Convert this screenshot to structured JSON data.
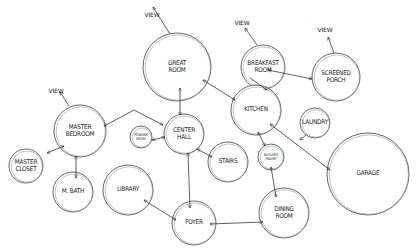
{
  "diagram": {
    "type": "bubble-diagram",
    "view_label": "VIEW",
    "colors": {
      "stroke": "#555555",
      "text": "#222222",
      "background": "#ffffff"
    },
    "rooms": [
      {
        "id": "great-room",
        "label": "GREAT\nROOM",
        "cx": 177,
        "cy": 67,
        "r": 34
      },
      {
        "id": "breakfast-room",
        "label": "BREAKFAST\nROOM",
        "cx": 263,
        "cy": 67,
        "r": 22
      },
      {
        "id": "screened-porch",
        "label": "SCREENED\nPORCH",
        "cx": 336,
        "cy": 77,
        "r": 24
      },
      {
        "id": "kitchen",
        "label": "KITCHEN",
        "cx": 256,
        "cy": 110,
        "r": 25
      },
      {
        "id": "laundry",
        "label": "LAUNDRY",
        "cx": 315,
        "cy": 123,
        "r": 15
      },
      {
        "id": "master-bedroom",
        "label": "MASTER\nBEDROOM",
        "cx": 80,
        "cy": 131,
        "r": 26
      },
      {
        "id": "powder-room",
        "label": "POWDER\nROOM",
        "cx": 141,
        "cy": 137,
        "r": 11,
        "small": true
      },
      {
        "id": "center-hall",
        "label": "CENTER\nHALL",
        "cx": 184,
        "cy": 134,
        "r": 20
      },
      {
        "id": "stairs",
        "label": "STAIRS",
        "cx": 228,
        "cy": 162,
        "r": 20
      },
      {
        "id": "butlers-pantry",
        "label": "BUTLER'S\nPANTRY",
        "cx": 271,
        "cy": 157,
        "r": 13,
        "small": true
      },
      {
        "id": "garage",
        "label": "GARAGE",
        "cx": 368,
        "cy": 174,
        "r": 41
      },
      {
        "id": "master-closet",
        "label": "MASTER\nCLOSET",
        "cx": 26,
        "cy": 166,
        "r": 17
      },
      {
        "id": "m-bath",
        "label": "M. BATH",
        "cx": 73,
        "cy": 192,
        "r": 20
      },
      {
        "id": "library",
        "label": "LIBRARY",
        "cx": 128,
        "cy": 190,
        "r": 25
      },
      {
        "id": "foyer",
        "label": "FOYER",
        "cx": 194,
        "cy": 223,
        "r": 22
      },
      {
        "id": "dining-room",
        "label": "DINING\nROOM",
        "cx": 284,
        "cy": 213,
        "r": 25
      }
    ],
    "views": [
      {
        "from": [
          170,
          34
        ],
        "to": [
          153,
          7
        ],
        "label_x": 152,
        "label_y": 14
      },
      {
        "from": [
          69,
          106
        ],
        "to": [
          60,
          92
        ],
        "label_x": 56,
        "label_y": 90
      },
      {
        "from": [
          257,
          45
        ],
        "to": [
          245,
          28
        ],
        "label_x": 242,
        "label_y": 22
      },
      {
        "from": [
          334,
          53
        ],
        "to": [
          328,
          37
        ],
        "label_x": 325,
        "label_y": 29
      }
    ],
    "connections": [
      {
        "from": [
          104,
          126
        ],
        "to": [
          163,
          125
        ],
        "via": [
          134,
          110
        ],
        "both": true
      },
      {
        "from": [
          180,
          115
        ],
        "to": [
          180,
          88
        ],
        "both": true
      },
      {
        "from": [
          203,
          80
        ],
        "to": [
          235,
          100
        ],
        "both": true
      },
      {
        "from": [
          250,
          78
        ],
        "to": [
          267,
          90
        ],
        "both": false,
        "a": [
          270,
          79
        ],
        "b": [
          243,
          94
        ]
      },
      {
        "from": [
          268,
          70
        ],
        "to": [
          312,
          79
        ],
        "both": true
      },
      {
        "from": [
          152,
          140
        ],
        "to": [
          165,
          137
        ],
        "both": true
      },
      {
        "from": [
          47,
          153
        ],
        "to": [
          64,
          146
        ],
        "both": true
      },
      {
        "from": [
          76,
          156
        ],
        "to": [
          76,
          178
        ],
        "both": true
      },
      {
        "from": [
          197,
          149
        ],
        "to": [
          212,
          157
        ],
        "both": true
      },
      {
        "from": [
          188,
          153
        ],
        "to": [
          190,
          208
        ],
        "both": true
      },
      {
        "from": [
          144,
          200
        ],
        "to": [
          176,
          220
        ],
        "both": true
      },
      {
        "from": [
          210,
          224
        ],
        "to": [
          263,
          222
        ],
        "both": true
      },
      {
        "from": [
          258,
          132
        ],
        "to": [
          265,
          146
        ],
        "both": true
      },
      {
        "from": [
          271,
          167
        ],
        "to": [
          276,
          197
        ],
        "both": true
      },
      {
        "from": [
          270,
          124
        ],
        "to": [
          330,
          170
        ],
        "both": true
      },
      {
        "from": [
          306,
          135
        ],
        "to": [
          300,
          140
        ],
        "both": false
      }
    ]
  }
}
